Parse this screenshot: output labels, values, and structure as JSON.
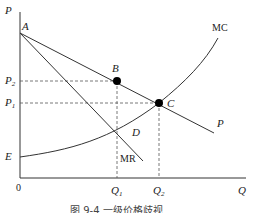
{
  "diagram": {
    "axes": {
      "y_label": "P",
      "x_label": "Q",
      "origin_label": "0"
    },
    "curves": {
      "demand": "P",
      "marginal_revenue": "MR",
      "marginal_cost": "MC"
    },
    "points": {
      "a": "A",
      "b": "B",
      "c": "C",
      "d": "D",
      "e": "E"
    },
    "price_ticks": {
      "p2": "P",
      "p2_sub": "2",
      "p1": "P",
      "p1_sub": "1"
    },
    "quantity_ticks": {
      "q1": "Q",
      "q1_sub": "1",
      "q2": "Q",
      "q2_sub": "2"
    },
    "caption": "图 9-4    一级价格歧视"
  },
  "colors": {
    "line": "#333333",
    "dot": "#000000",
    "dash": "#555555"
  }
}
